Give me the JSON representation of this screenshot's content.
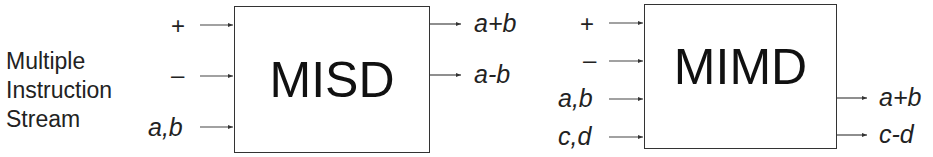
{
  "side_label": {
    "lines": [
      "Multiple",
      "Instruction",
      "Stream"
    ]
  },
  "misd": {
    "title": "MISD",
    "inputs": [
      "+",
      "–",
      "a,b"
    ],
    "outputs": [
      "a+b",
      "a-b"
    ]
  },
  "mimd": {
    "title": "MIMD",
    "inputs": [
      "+",
      "–",
      "a,b",
      "c,d"
    ],
    "outputs": [
      "a+b",
      "c-d"
    ]
  },
  "colors": {
    "line": "#333333",
    "text": "#222222",
    "background": "#ffffff"
  }
}
